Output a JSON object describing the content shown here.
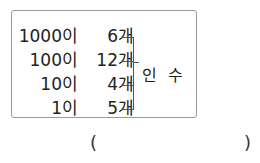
{
  "problem": {
    "rows": [
      {
        "place": "1000이",
        "count": "6개"
      },
      {
        "place": "100이",
        "count": "12개"
      },
      {
        "place": "10이",
        "count": "4개"
      },
      {
        "place": "1이",
        "count": "5개"
      }
    ],
    "bracket_label": "인 수",
    "answer": {
      "open": "(",
      "close": ")",
      "value": ""
    }
  }
}
